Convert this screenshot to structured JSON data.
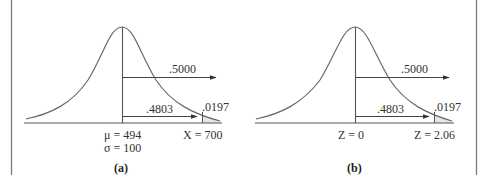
{
  "colors": {
    "line": "#555555",
    "curve": "#6a6a6a",
    "tail_fill": "#e6e6e6",
    "border": "#7a7a7a",
    "text": "#333333"
  },
  "panels": [
    {
      "id": "a",
      "caption": "(a)",
      "upper_arrow_label": ".5000",
      "lower_arrow_label": ".4803",
      "tail_label": ".0197",
      "center_label_1": "μ = 494",
      "center_label_2": "σ = 100",
      "tail_axis_label": "X = 700"
    },
    {
      "id": "b",
      "caption": "(b)",
      "upper_arrow_label": ".5000",
      "lower_arrow_label": ".4803",
      "tail_label": ".0197",
      "center_label_1": "Z = 0",
      "tail_axis_label": "Z = 2.06"
    }
  ]
}
